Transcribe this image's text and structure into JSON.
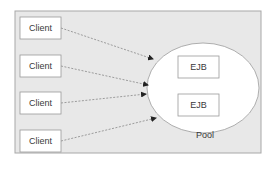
{
  "diagram": {
    "colors": {
      "frame_fill": "#e8e8e8",
      "frame_stroke": "#a8a8a8",
      "box_fill": "#ffffff",
      "box_stroke": "#9a9a9a",
      "ellipse_fill": "#ffffff",
      "ellipse_stroke": "#9a9a9a",
      "arrow_stroke": "#7a7a7a",
      "arrowhead_fill": "#222222",
      "text": "#3a3a3a"
    },
    "clients": [
      {
        "label": "Client"
      },
      {
        "label": "Client"
      },
      {
        "label": "Client"
      },
      {
        "label": "Client"
      }
    ],
    "pool": {
      "label": "Pool",
      "beans": [
        {
          "label": "EJB"
        },
        {
          "label": "EJB"
        }
      ]
    },
    "connections": [
      {
        "from": "client-1",
        "to": "pool",
        "style": "dashed"
      },
      {
        "from": "client-2",
        "to": "pool",
        "style": "dashed"
      },
      {
        "from": "client-3",
        "to": "pool",
        "style": "dashed"
      },
      {
        "from": "client-4",
        "to": "pool",
        "style": "dashed"
      }
    ]
  }
}
